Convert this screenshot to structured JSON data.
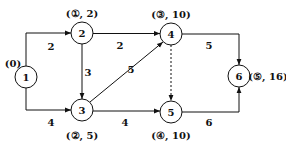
{
  "diagram": {
    "type": "directed-network",
    "nodes": [
      {
        "id": "1",
        "label": "1",
        "x": 26,
        "y": 77,
        "mark": "(0)",
        "mark_x": 12,
        "mark_y": 63
      },
      {
        "id": "2",
        "label": "2",
        "x": 82,
        "y": 33,
        "mark": "(①, 2)",
        "mark_x": 82,
        "mark_y": 16
      },
      {
        "id": "3",
        "label": "3",
        "x": 82,
        "y": 110,
        "mark": "(②, 5)",
        "mark_x": 82,
        "mark_y": 136
      },
      {
        "id": "4",
        "label": "4",
        "x": 171,
        "y": 34,
        "mark": "(③, 10)",
        "mark_x": 171,
        "mark_y": 17
      },
      {
        "id": "5",
        "label": "5",
        "x": 171,
        "y": 112,
        "mark": "(④, 10)",
        "mark_x": 171,
        "mark_y": 136
      },
      {
        "id": "6",
        "label": "6",
        "x": 239,
        "y": 76,
        "mark": "(⑤, 16)",
        "mark_x": 270,
        "mark_y": 66
      }
    ],
    "edges": [
      {
        "from": "1",
        "to": "2",
        "weight": "2",
        "style": "solid",
        "label_x": 51,
        "label_y": 49
      },
      {
        "from": "1",
        "to": "3",
        "weight": "4",
        "style": "solid",
        "label_x": 51,
        "label_y": 125
      },
      {
        "from": "2",
        "to": "3",
        "weight": "3",
        "style": "solid",
        "label_x": 88,
        "label_y": 75
      },
      {
        "from": "2",
        "to": "4",
        "weight": "2",
        "style": "solid",
        "label_x": 120,
        "label_y": 48
      },
      {
        "from": "3",
        "to": "4",
        "weight": "5",
        "style": "solid",
        "label_x": 131,
        "label_y": 72
      },
      {
        "from": "3",
        "to": "5",
        "weight": "4",
        "style": "solid",
        "label_x": 125,
        "label_y": 125
      },
      {
        "from": "4",
        "to": "5",
        "weight": "",
        "style": "dashed"
      },
      {
        "from": "4",
        "to": "6",
        "weight": "5",
        "style": "solid",
        "label_x": 209,
        "label_y": 48
      },
      {
        "from": "5",
        "to": "6",
        "weight": "6",
        "style": "solid",
        "label_x": 209,
        "label_y": 125
      }
    ]
  }
}
